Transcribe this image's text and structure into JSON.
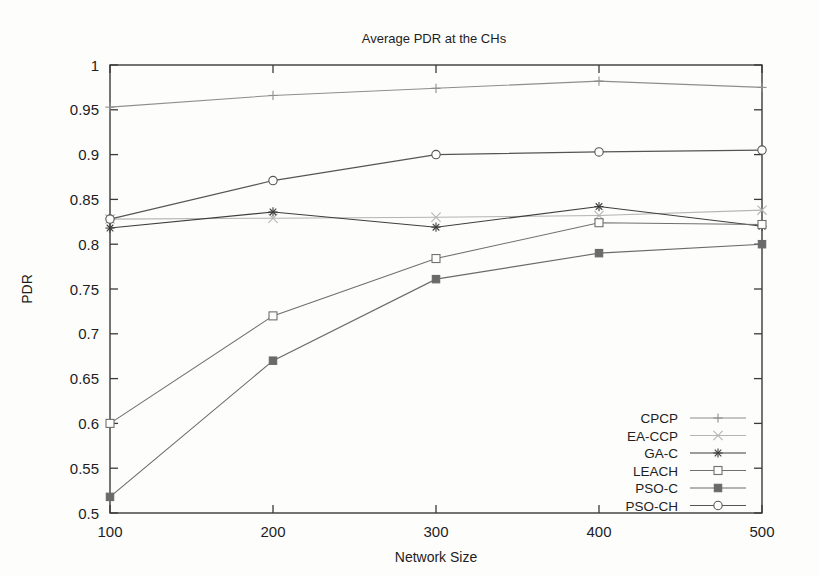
{
  "chart_data": {
    "type": "line",
    "title": "Average PDR at the CHs",
    "xlabel": "Network Size",
    "ylabel": "PDR",
    "x": [
      100,
      200,
      300,
      400,
      500
    ],
    "xticks": [
      "100",
      "200",
      "300",
      "400",
      "500"
    ],
    "xlim": [
      100,
      500
    ],
    "yticks": [
      "0.5",
      "0.55",
      "0.6",
      "0.65",
      "0.7",
      "0.75",
      "0.8",
      "0.85",
      "0.9",
      "0.95",
      "1"
    ],
    "ylim": [
      0.5,
      1.0
    ],
    "grid": false,
    "legend_position": "bottom-right-inside",
    "series": [
      {
        "name": "CPCP",
        "marker": "plus",
        "color": "#8e8e8e",
        "values": [
          0.953,
          0.966,
          0.974,
          0.982,
          0.975
        ]
      },
      {
        "name": "EA-CCP",
        "marker": "cross",
        "color": "#b4b4b4",
        "values": [
          0.828,
          0.829,
          0.83,
          0.832,
          0.838
        ]
      },
      {
        "name": "GA-C",
        "marker": "star",
        "color": "#3d3d3d",
        "values": [
          0.818,
          0.836,
          0.819,
          0.842,
          0.82
        ]
      },
      {
        "name": "LEACH",
        "marker": "open-square",
        "color": "#707070",
        "values": [
          0.6,
          0.72,
          0.784,
          0.824,
          0.822
        ]
      },
      {
        "name": "PSO-C",
        "marker": "filled-square",
        "color": "#6a6a6a",
        "values": [
          0.518,
          0.67,
          0.761,
          0.79,
          0.8
        ]
      },
      {
        "name": "PSO-CH",
        "marker": "open-circle",
        "color": "#555555",
        "values": [
          0.828,
          0.871,
          0.9,
          0.903,
          0.905
        ]
      }
    ]
  },
  "legend": {
    "entries": [
      {
        "label": "CPCP"
      },
      {
        "label": "EA-CCP"
      },
      {
        "label": "GA-C"
      },
      {
        "label": "LEACH"
      },
      {
        "label": "PSO-C"
      },
      {
        "label": "PSO-CH"
      }
    ]
  },
  "colors": {
    "axis": "#3a3a3a",
    "text": "#1e1e1e",
    "background": "#fdfdfc"
  }
}
